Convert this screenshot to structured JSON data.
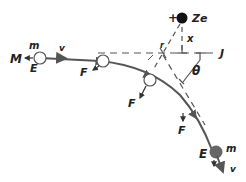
{
  "diagram": {
    "title": "",
    "colors": {
      "line": "#555555",
      "text": "#222222",
      "nucleus": "#111111",
      "particle_final": "#666666",
      "dash": "#555555"
    },
    "nucleus": {
      "sign": "+",
      "label": "Ze"
    },
    "labels": {
      "x": "x",
      "r": "r",
      "theta": "θ",
      "J": "J",
      "M": "M",
      "m_initial": "m",
      "E_initial": "E",
      "v_initial": "v",
      "F1": "F",
      "F2": "F",
      "F3": "F",
      "m_final": "m",
      "E_final": "E",
      "v_final": "v",
      "dash_prefix": "—"
    }
  }
}
